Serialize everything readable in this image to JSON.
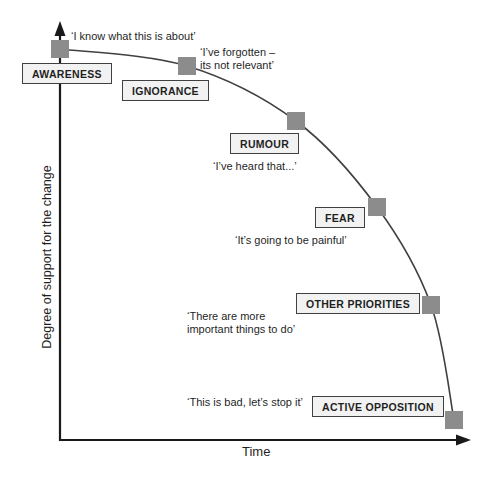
{
  "colors": {
    "background": "#ffffff",
    "marker": "#8c8c8c",
    "box_fill": "#f2f2f2",
    "box_border": "#404040",
    "curve": "#404040",
    "axis": "#1a1a1a",
    "text": "#1f1f1f"
  },
  "chart_data": {
    "type": "line",
    "title": "",
    "xlabel": "Time",
    "ylabel": "Degree of support for the change",
    "grid": false,
    "legend": false,
    "axes": "qualitative, no tick marks or numeric scale; arrows on both axis ends",
    "curve_description": "Smooth concave curve declining from high support at top-left to low support at bottom-right, passing through six square gray markers",
    "stages": [
      {
        "label": "AWARENESS",
        "quote": "‘I know what this is about’",
        "marker_x": 60,
        "marker_y": 49
      },
      {
        "label": "IGNORANCE",
        "quote": "‘I’ve forgotten –\nits not relevant’",
        "marker_x": 187,
        "marker_y": 66
      },
      {
        "label": "RUMOUR",
        "quote": "‘I’ve heard that...’",
        "marker_x": 296,
        "marker_y": 121
      },
      {
        "label": "FEAR",
        "quote": "‘It’s going to be painful’",
        "marker_x": 377,
        "marker_y": 207
      },
      {
        "label": "OTHER PRIORITIES",
        "quote": "‘There are more\nimportant things to do’",
        "marker_x": 431,
        "marker_y": 305
      },
      {
        "label": "ACTIVE OPPOSITION",
        "quote": "‘This is bad, let’s stop it’",
        "marker_x": 454,
        "marker_y": 420
      }
    ]
  }
}
